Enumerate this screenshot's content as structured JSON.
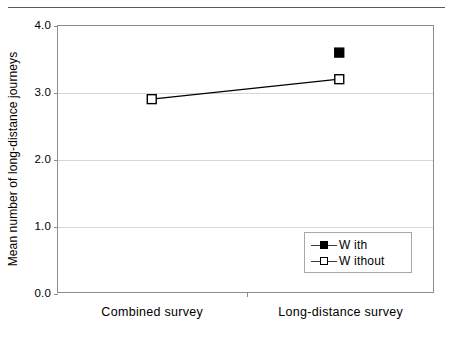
{
  "chart_data": {
    "type": "line",
    "title": "",
    "xlabel": "",
    "ylabel": "Mean number of long-distance journeys",
    "categories": [
      "Combined survey",
      "Long-distance survey"
    ],
    "ylim": [
      0.0,
      4.0
    ],
    "ytick_labels": [
      "0.0",
      "1.0",
      "2.0",
      "3.0",
      "4.0"
    ],
    "ytick_values": [
      0.0,
      1.0,
      2.0,
      3.0,
      4.0
    ],
    "grid": true,
    "legend_position": "bottom-right",
    "series": [
      {
        "name": "With",
        "legend_label": "W ith",
        "marker": "filled-square",
        "color": "#000000",
        "connected": false,
        "values": [
          null,
          3.6
        ]
      },
      {
        "name": "Without",
        "legend_label": "W ithout",
        "marker": "hollow-square",
        "color": "#000000",
        "connected": true,
        "values": [
          2.9,
          3.2
        ]
      }
    ]
  },
  "figure": {
    "top_rule": true
  }
}
